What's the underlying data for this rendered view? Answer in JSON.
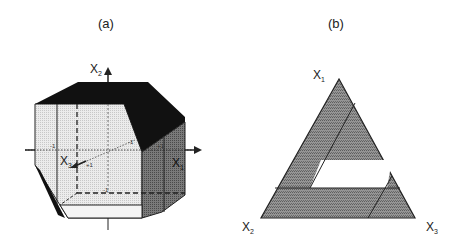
{
  "panels": {
    "a": {
      "label": "(a)",
      "axes": {
        "x1": {
          "name": "X",
          "sub": "1"
        },
        "x2": {
          "name": "X",
          "sub": "2"
        },
        "x3": {
          "name": "X",
          "sub": "3"
        }
      },
      "ticks": {
        "left_x1": "-1",
        "right_x1": "+1",
        "x3_near": "+1",
        "x3_far": "-1",
        "bottom_x2": "-1"
      }
    },
    "b": {
      "label": "(b)",
      "vertices": {
        "top": {
          "name": "X",
          "sub": "1"
        },
        "bottom_left": {
          "name": "X",
          "sub": "2"
        },
        "bottom_right": {
          "name": "X",
          "sub": "3"
        }
      }
    }
  },
  "colors": {
    "black_face": "#111111",
    "light_face": "#e6e6e6",
    "dark_face": "#6e6e6e",
    "triangle_fill": "#8a8a8a",
    "white_region": "#ffffff",
    "line": "#222222"
  }
}
